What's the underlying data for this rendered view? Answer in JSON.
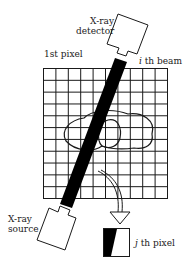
{
  "diagram": {
    "labels": {
      "detector_line1": "X-ray",
      "detector_line2": "detector",
      "first_pixel": "1st pixel",
      "beam_index": "i",
      "beam_suffix": " th beam",
      "source_line1": "X-ray",
      "source_line2": "source",
      "pixel_index": "j",
      "pixel_suffix": " th pixel"
    },
    "grid": {
      "columns": 10,
      "rows": 11,
      "x": 43,
      "y": 68,
      "width": 124,
      "height": 130
    },
    "colors": {
      "line": "#1a1a1a",
      "beam": "#000000",
      "background": "#ffffff"
    },
    "components": [
      "x-ray-detector",
      "x-ray-source",
      "pixel-grid",
      "object-outline",
      "ith-beam",
      "jth-pixel-inset",
      "arrow"
    ]
  }
}
